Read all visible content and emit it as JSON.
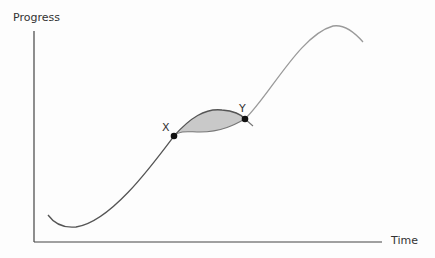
{
  "diagram": {
    "y_axis_label": "Progress",
    "x_axis_label": "Time",
    "points": [
      {
        "label": "X"
      },
      {
        "label": "Y"
      }
    ],
    "colors": {
      "axis": "#444444",
      "curve_dark": "#555555",
      "curve_light": "#9a9a9a",
      "fill": "#c8c8c8",
      "point": "#111111",
      "background": "#fdfdfd"
    }
  }
}
